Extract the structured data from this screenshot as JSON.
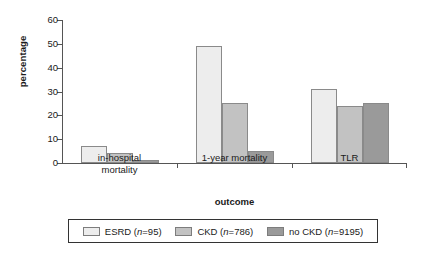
{
  "chart_data": {
    "type": "bar",
    "title": "",
    "subtitle": "",
    "xlabel": "outcome",
    "ylabel": "percentage",
    "categories": [
      "in-hospital\nmortality",
      "1-year mortality",
      "TLR"
    ],
    "series": [
      {
        "name": "ESRD (n=95)",
        "values": [
          7,
          49,
          31
        ],
        "color": "#ededed"
      },
      {
        "name": "CKD (n=786)",
        "values": [
          4,
          25,
          24
        ],
        "color": "#c2c2c2"
      },
      {
        "name": "no CKD (n=9195)",
        "values": [
          1.2,
          5,
          25
        ],
        "color": "#9a9a9a"
      }
    ],
    "ylim": [
      0,
      60
    ],
    "yticks": [
      0,
      10,
      20,
      30,
      40,
      50,
      60
    ],
    "ytick_labels": [
      "0",
      "10",
      "20",
      "30",
      "40",
      "50",
      "60"
    ],
    "grid": false,
    "legend_position": "bottom",
    "legend_entries": [
      {
        "label_main": "ESRD (",
        "label_italic": "n",
        "label_tail": "=95)"
      },
      {
        "label_main": "CKD (",
        "label_italic": "n",
        "label_tail": "=786)"
      },
      {
        "label_main": "no CKD (",
        "label_italic": "n",
        "label_tail": "=9195)"
      }
    ],
    "axis_color": "#555555",
    "bar_border_color": "#8a8a8a",
    "background": "#ffffff"
  }
}
